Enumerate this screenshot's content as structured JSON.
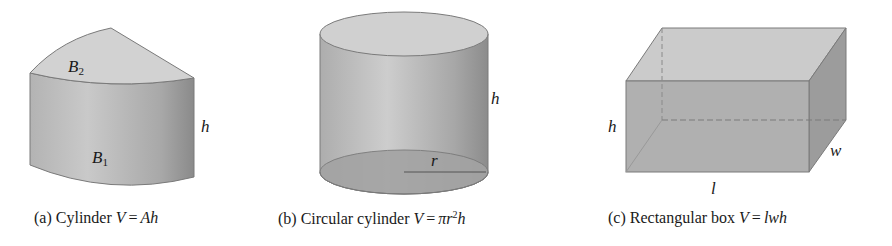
{
  "figures": [
    {
      "id": "a",
      "shape": "general-cylinder",
      "caption": {
        "prefix": "(a) Cylinder",
        "var": "V",
        "eq": "=",
        "formula": "Ah"
      },
      "labels": {
        "top_base": "B",
        "top_base_sub": "2",
        "bottom_base": "B",
        "bottom_base_sub": "1",
        "height": "h"
      }
    },
    {
      "id": "b",
      "shape": "circular-cylinder",
      "caption": {
        "prefix": "(b) Circular cylinder",
        "var": "V",
        "eq": "=",
        "formula_pre": "πr",
        "formula_sup": "2",
        "formula_post": "h"
      },
      "labels": {
        "height": "h",
        "radius": "r"
      }
    },
    {
      "id": "c",
      "shape": "rectangular-box",
      "caption": {
        "prefix": "(c) Rectangular box",
        "var": "V",
        "eq": "=",
        "formula": "lwh"
      },
      "labels": {
        "height": "h",
        "width": "w",
        "length": "l"
      }
    }
  ],
  "colors": {
    "top_face": "#cfcfcf",
    "side_light": "#c4c4c4",
    "side_dark": "#8e8e8e",
    "edge": "#7a7a7a",
    "bottom_face": "#a9a9a9"
  }
}
